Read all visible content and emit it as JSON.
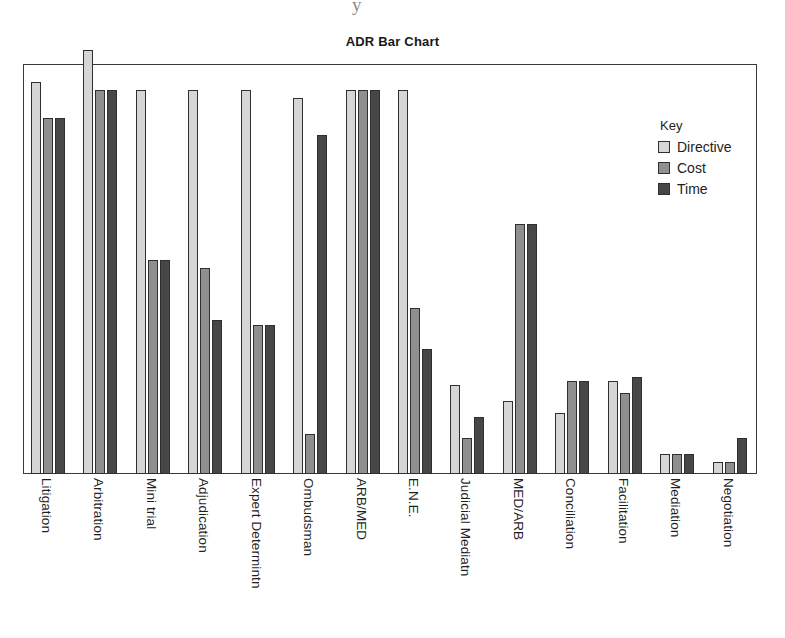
{
  "chart_data": {
    "type": "bar",
    "title": "ADR Bar Chart",
    "xlabel": "",
    "ylabel": "",
    "ylim": [
      0,
      100
    ],
    "grid": false,
    "legend_position": "top-right-inside",
    "legend_title": "Key",
    "categories": [
      "Litigation",
      "Arbitration",
      "Mini trial",
      "Adjudication",
      "Expert Determintn",
      "Ombudsman",
      "ARB/MED",
      "E.N.E.",
      "Judicial Mediatn",
      "MED/ARB",
      "Conciliation",
      "Facilitation",
      "Mediation",
      "Negotiation"
    ],
    "series": [
      {
        "name": "Directive",
        "color": "#d6d6d6",
        "values": [
          97,
          105,
          95,
          95,
          95,
          93,
          95,
          95,
          22,
          18,
          15,
          23,
          5,
          3
        ]
      },
      {
        "name": "Cost",
        "color": "#8f8f8f",
        "values": [
          88,
          95,
          53,
          51,
          37,
          10,
          95,
          41,
          9,
          62,
          23,
          20,
          5,
          3
        ]
      },
      {
        "name": "Time",
        "color": "#474747",
        "values": [
          88,
          95,
          53,
          38,
          37,
          84,
          95,
          31,
          14,
          62,
          23,
          24,
          5,
          9
        ]
      }
    ]
  },
  "legend": {
    "title": "Key",
    "entries": [
      {
        "label": "Directive"
      },
      {
        "label": "Cost"
      },
      {
        "label": "Time"
      }
    ]
  },
  "artifact": {
    "mark": "y"
  }
}
